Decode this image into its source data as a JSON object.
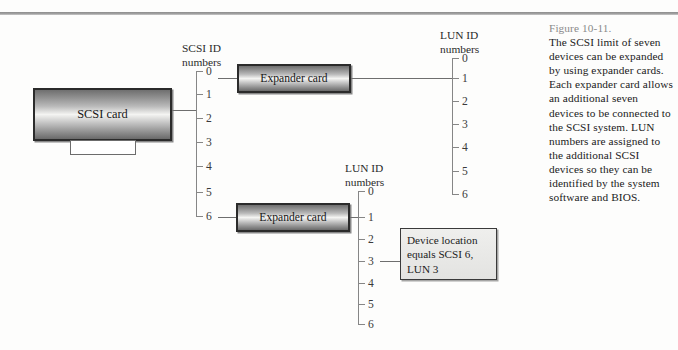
{
  "figure": {
    "number_label": "Figure 10-11.",
    "caption": "The SCSI limit of seven devices can be expanded by using expander cards. Each expander card allows an additional seven devices to be connected to the SCSI system. LUN numbers are assigned to the additional SCSI devices so they can be identified by the system software and BIOS."
  },
  "diagram": {
    "scsi_card": {
      "label": "SCSI card"
    },
    "expander_card_top": {
      "label": "Expander card"
    },
    "expander_card_bottom": {
      "label": "Expander card"
    },
    "device_location_box": {
      "label": "Device location equals SCSI 6, LUN 3"
    },
    "scsi_bus": {
      "title_line_1": "SCSI ID",
      "title_line_2": "numbers",
      "ticks": [
        "0",
        "1",
        "2",
        "3",
        "4",
        "5",
        "6"
      ],
      "connected_host_tick": "1",
      "expander_top_tick": "0",
      "expander_bottom_tick": "6"
    },
    "lun_bus_top": {
      "title_line_1": "LUN ID",
      "title_line_2": "numbers",
      "ticks": [
        "0",
        "1",
        "2",
        "3",
        "4",
        "5",
        "6"
      ],
      "connected_tick": "1"
    },
    "lun_bus_bottom": {
      "title_line_1": "LUN ID",
      "title_line_2": "numbers",
      "ticks": [
        "0",
        "1",
        "2",
        "3",
        "4",
        "5",
        "6"
      ],
      "connected_tick": "1",
      "device_tick": "3"
    },
    "colors": {
      "rule": "#9e9e9e",
      "bus_line": "#868686",
      "card_border": "#2b2b2b",
      "caption_number": "#8a8a8a",
      "text": "#1b1b1b"
    }
  }
}
